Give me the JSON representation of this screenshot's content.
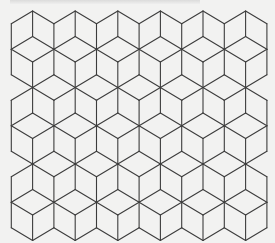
{
  "figure": {
    "caption_visible": false,
    "colors": {
      "background": "#f2f2f1",
      "line": "#3c3c3c"
    },
    "line_width": 1.1,
    "lattice": {
      "origin_x": 11.3,
      "origin_y": 11.0,
      "step_x": 21.3,
      "step_y": 12.75,
      "i_min": 0,
      "i_max": 12,
      "j_min": 0,
      "j_max": 18
    },
    "cube_rows": [
      {
        "center_j": 1,
        "center_i": [
          0,
          2,
          4,
          6,
          8,
          10,
          12
        ]
      },
      {
        "center_j": 4,
        "center_i": [
          1,
          3,
          5,
          7,
          9,
          11
        ]
      },
      {
        "center_j": 7,
        "center_i": [
          0,
          2,
          4,
          6,
          8,
          10,
          12
        ]
      },
      {
        "center_j": 10,
        "center_i": [
          1,
          3,
          5,
          7,
          9,
          11
        ]
      },
      {
        "center_j": 13,
        "center_i": [
          0,
          2,
          4,
          6,
          8,
          10,
          12
        ]
      },
      {
        "center_j": 16,
        "center_i": [
          1,
          3,
          5,
          7,
          9,
          11
        ]
      },
      {
        "center_j": 19,
        "center_i": [
          0,
          2,
          4,
          6,
          8,
          10,
          12
        ]
      }
    ],
    "counts": {
      "full_cubes_wide": 6,
      "cube_rows_visible": 6
    }
  }
}
